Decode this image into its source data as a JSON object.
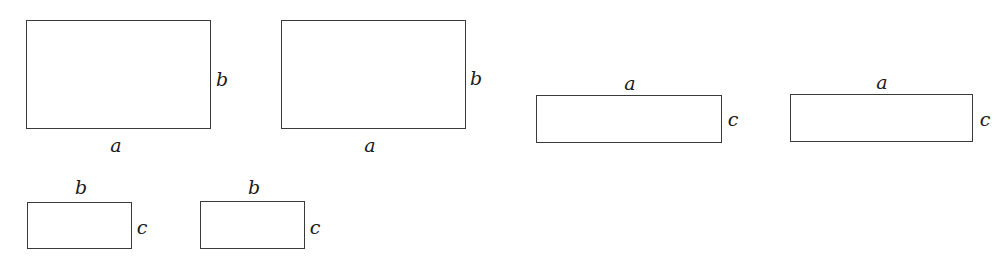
{
  "diagram": {
    "rectangles": [
      {
        "id": "r1",
        "box": {
          "x": 26,
          "y": 20,
          "w": 185,
          "h": 109
        },
        "labels": [
          {
            "text": "a",
            "x": 116,
            "y": 145
          },
          {
            "text": "b",
            "x": 222,
            "y": 79
          }
        ]
      },
      {
        "id": "r2",
        "box": {
          "x": 281,
          "y": 20,
          "w": 185,
          "h": 109
        },
        "labels": [
          {
            "text": "a",
            "x": 370,
            "y": 145
          },
          {
            "text": "b",
            "x": 476,
            "y": 78
          }
        ]
      },
      {
        "id": "r3",
        "box": {
          "x": 536,
          "y": 95,
          "w": 186,
          "h": 48
        },
        "labels": [
          {
            "text": "a",
            "x": 630,
            "y": 83
          },
          {
            "text": "c",
            "x": 733,
            "y": 119
          }
        ]
      },
      {
        "id": "r4",
        "box": {
          "x": 790,
          "y": 94,
          "w": 183,
          "h": 48
        },
        "labels": [
          {
            "text": "a",
            "x": 882,
            "y": 82
          },
          {
            "text": "c",
            "x": 985,
            "y": 119
          }
        ]
      },
      {
        "id": "r5",
        "box": {
          "x": 27,
          "y": 202,
          "w": 105,
          "h": 47
        },
        "labels": [
          {
            "text": "b",
            "x": 81,
            "y": 187
          },
          {
            "text": "c",
            "x": 142,
            "y": 227
          }
        ]
      },
      {
        "id": "r6",
        "box": {
          "x": 200,
          "y": 201,
          "w": 105,
          "h": 48
        },
        "labels": [
          {
            "text": "b",
            "x": 254,
            "y": 187
          },
          {
            "text": "c",
            "x": 315,
            "y": 227
          }
        ]
      }
    ]
  }
}
